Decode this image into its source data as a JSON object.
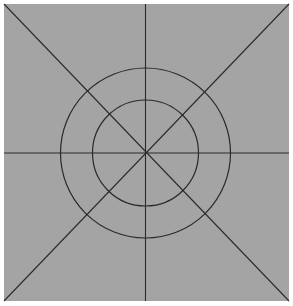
{
  "diagram": {
    "background": "#ffffff",
    "panel": {
      "x": 4,
      "y": 4,
      "width": 285,
      "height": 297,
      "fill": "#a4a4a4"
    },
    "stroke": "#2a2a2a",
    "center": {
      "x": 145.5,
      "y": 153
    },
    "circles": [
      {
        "name": "outer-circle",
        "r": 85
      },
      {
        "name": "inner-circle",
        "r": 53
      }
    ],
    "lines": [
      {
        "name": "vertical-axis",
        "x1": 145.5,
        "y1": 4,
        "x2": 145.5,
        "y2": 301
      },
      {
        "name": "horizontal-axis",
        "x1": 4,
        "y1": 153,
        "x2": 289,
        "y2": 153
      },
      {
        "name": "diagonal-tl-br",
        "x1": 4,
        "y1": 4,
        "x2": 289,
        "y2": 301
      },
      {
        "name": "diagonal-tr-bl",
        "x1": 289,
        "y1": 4,
        "x2": 4,
        "y2": 301
      }
    ]
  }
}
